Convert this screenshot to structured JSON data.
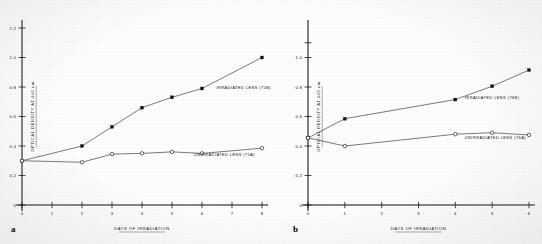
{
  "figure": {
    "panels": [
      {
        "letter": "a",
        "axes": {
          "xlabel": "DAYS OF IRRADIATION",
          "ylabel": "OPTICAL DENSITY AT 440 nm",
          "xticks": [
            "0",
            "1",
            "2",
            "3",
            "4",
            "5",
            "6",
            "7",
            "8"
          ],
          "yticks": [
            "0",
            "0.2",
            "0.4",
            "0.6",
            "0.8",
            "1.0",
            "1.2"
          ],
          "xlim": [
            0,
            8
          ],
          "ylim": [
            0,
            1.2
          ]
        },
        "series": [
          {
            "name": "IRRADIATED LENS (75B)",
            "marker": "filled-square",
            "x": [
              0,
              2,
              3,
              4,
              5,
              6,
              8
            ],
            "y": [
              0.3,
              0.4,
              0.53,
              0.66,
              0.73,
              0.79,
              1.0
            ],
            "label_x": 6.35,
            "label_y": 0.795
          },
          {
            "name": "UNIRRADIATED LENS (75A)",
            "marker": "open-circle",
            "x": [
              0,
              2,
              3,
              4,
              5,
              6,
              8
            ],
            "y": [
              0.3,
              0.29,
              0.345,
              0.35,
              0.36,
              0.35,
              0.385
            ],
            "label_x": 5.6,
            "label_y": 0.345
          }
        ]
      },
      {
        "letter": "b",
        "axes": {
          "xlabel": "DAYS OF IRRADIATION",
          "ylabel": "OPTICAL DENSITY AT 440 nm",
          "xticks": [
            "0",
            "1",
            "2",
            "3",
            "4",
            "5",
            "6"
          ],
          "yticks": [
            "0",
            "0.2",
            "0.4",
            "0.6",
            "0.8",
            "1.0"
          ],
          "xlim": [
            0,
            6
          ],
          "ylim": [
            0,
            1.2
          ]
        },
        "series": [
          {
            "name": "IRRADIATED LENS (76B)",
            "marker": "filled-square",
            "x": [
              0,
              1,
              4,
              5,
              6
            ],
            "y": [
              0.455,
              0.585,
              0.715,
              0.805,
              0.915
            ],
            "label_x": 4.15,
            "label_y": 0.725
          },
          {
            "name": "UNIRRADIATED LENS (76A)",
            "marker": "open-circle",
            "x": [
              0,
              1,
              4,
              5,
              6
            ],
            "y": [
              0.455,
              0.4,
              0.48,
              0.49,
              0.475
            ],
            "label_x": 4.15,
            "label_y": 0.455
          }
        ]
      }
    ]
  },
  "chart_data": [
    {
      "type": "line",
      "panel": "a",
      "title": "",
      "xlabel": "DAYS OF IRRADIATION",
      "ylabel": "OPTICAL DENSITY AT 440 nm",
      "xlim": [
        0,
        8
      ],
      "ylim": [
        0,
        1.2
      ],
      "xticks": [
        0,
        1,
        2,
        3,
        4,
        5,
        6,
        7,
        8
      ],
      "yticks": [
        0,
        0.2,
        0.4,
        0.6,
        0.8,
        1.0,
        1.2
      ],
      "grid": false,
      "legend": "inline-annotations",
      "series": [
        {
          "name": "IRRADIATED LENS (75B)",
          "marker": "filled-square",
          "x": [
            0,
            2,
            3,
            4,
            5,
            6,
            8
          ],
          "values": [
            0.3,
            0.4,
            0.53,
            0.66,
            0.73,
            0.79,
            1.0
          ]
        },
        {
          "name": "UNIRRADIATED LENS (75A)",
          "marker": "open-circle",
          "x": [
            0,
            2,
            3,
            4,
            5,
            6,
            8
          ],
          "values": [
            0.3,
            0.29,
            0.345,
            0.35,
            0.36,
            0.35,
            0.385
          ]
        }
      ]
    },
    {
      "type": "line",
      "panel": "b",
      "title": "",
      "xlabel": "DAYS OF IRRADIATION",
      "ylabel": "OPTICAL DENSITY AT 440 nm",
      "xlim": [
        0,
        6
      ],
      "ylim": [
        0,
        1.2
      ],
      "xticks": [
        0,
        1,
        2,
        3,
        4,
        5,
        6
      ],
      "yticks": [
        0,
        0.2,
        0.4,
        0.6,
        0.8,
        1.0
      ],
      "grid": false,
      "legend": "inline-annotations",
      "series": [
        {
          "name": "IRRADIATED LENS (76B)",
          "marker": "filled-square",
          "x": [
            0,
            1,
            4,
            5,
            6
          ],
          "values": [
            0.455,
            0.585,
            0.715,
            0.805,
            0.915
          ]
        },
        {
          "name": "UNIRRADIATED LENS (76A)",
          "marker": "open-circle",
          "x": [
            0,
            1,
            4,
            5,
            6
          ],
          "values": [
            0.455,
            0.4,
            0.48,
            0.49,
            0.475
          ]
        }
      ]
    }
  ]
}
